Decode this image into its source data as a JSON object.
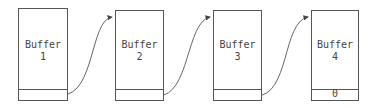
{
  "diagram": {
    "type": "linked-list-of-buffers",
    "buffers": [
      {
        "name": "Buffer",
        "number": "1",
        "pointer_value": ""
      },
      {
        "name": "Buffer",
        "number": "2",
        "pointer_value": ""
      },
      {
        "name": "Buffer",
        "number": "3",
        "pointer_value": ""
      },
      {
        "name": "Buffer",
        "number": "4",
        "pointer_value": "0"
      }
    ],
    "links": [
      {
        "from": "1",
        "to": "2"
      },
      {
        "from": "2",
        "to": "3"
      },
      {
        "from": "3",
        "to": "4"
      }
    ],
    "colors": {
      "stroke": "#555555",
      "text": "#444444",
      "background": "#ffffff"
    }
  }
}
